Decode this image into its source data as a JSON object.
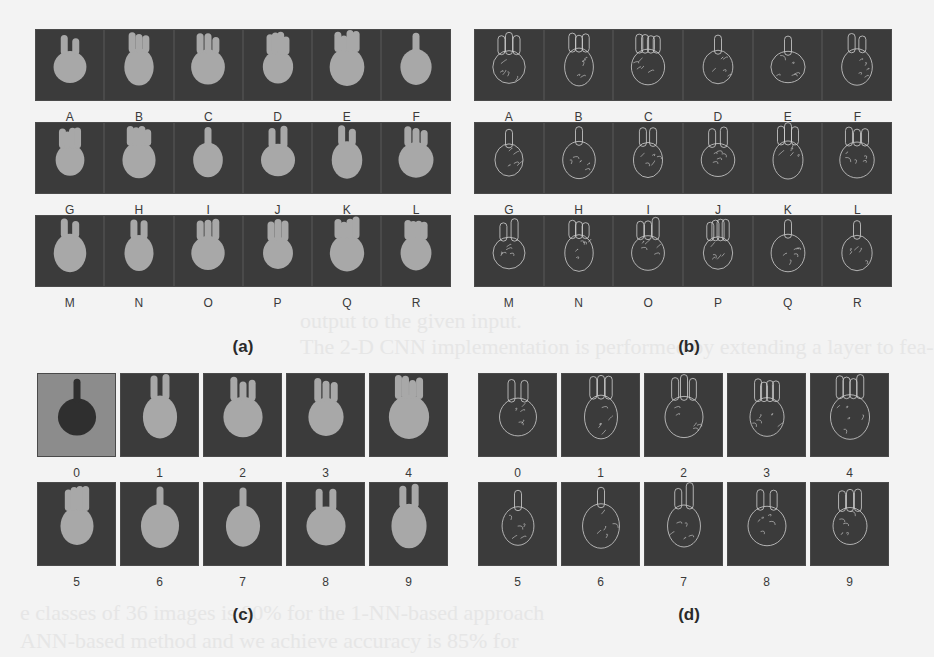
{
  "figure": {
    "panels": [
      {
        "id": "a",
        "caption": "(a)",
        "style": "rgb",
        "rows": [
          [
            "A",
            "B",
            "C",
            "D",
            "E",
            "F"
          ],
          [
            "G",
            "H",
            "I",
            "J",
            "K",
            "L"
          ],
          [
            "M",
            "N",
            "O",
            "P",
            "Q",
            "R"
          ]
        ]
      },
      {
        "id": "b",
        "caption": "(b)",
        "style": "edge",
        "rows": [
          [
            "A",
            "B",
            "C",
            "D",
            "E",
            "F"
          ],
          [
            "G",
            "H",
            "I",
            "J",
            "K",
            "L"
          ],
          [
            "M",
            "N",
            "O",
            "P",
            "Q",
            "R"
          ]
        ]
      },
      {
        "id": "c",
        "caption": "(c)",
        "style": "rgb",
        "rows": [
          [
            "0",
            "1",
            "2",
            "3",
            "4"
          ],
          [
            "5",
            "6",
            "7",
            "8",
            "9"
          ]
        ]
      },
      {
        "id": "d",
        "caption": "(d)",
        "style": "edge",
        "rows": [
          [
            "0",
            "1",
            "2",
            "3",
            "4"
          ],
          [
            "5",
            "6",
            "7",
            "8",
            "9"
          ]
        ]
      }
    ],
    "bleed_through_text": [
      "output to the given input.",
      "The 2-D CNN implementation is performed by extending a layer to fea-",
      "e classes of 36 images is 80% for the 1-NN-based approach",
      "ANN-based method and we achieve accuracy is 85% for"
    ]
  },
  "colors": {
    "page_background": "#f3f3f3",
    "cell_background": "#3b3b3b",
    "cell_light_background": "#8c8c8c",
    "hand_rgb": "#a8a8a8",
    "hand_edge": "#d0d0d0",
    "label_text": "#3a3a3a"
  }
}
